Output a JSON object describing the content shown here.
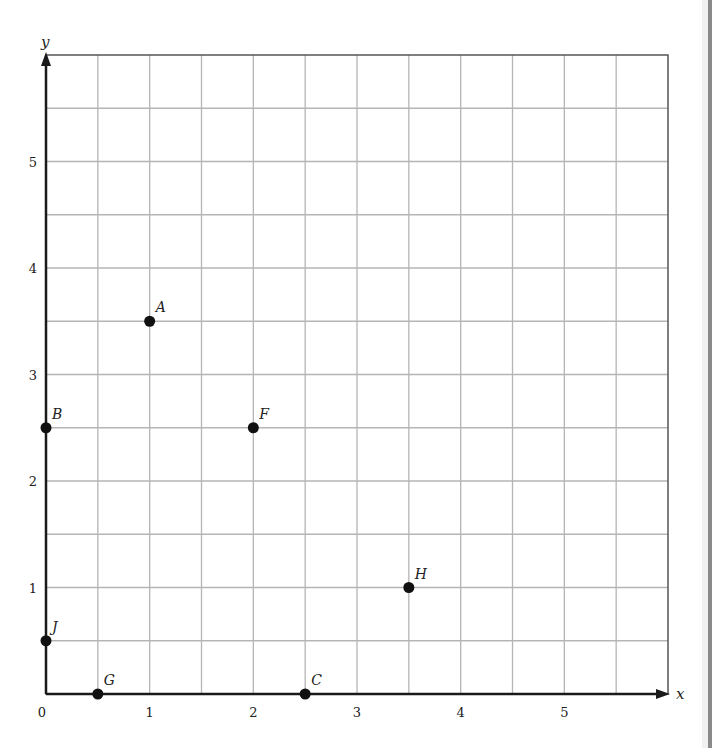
{
  "chart_data": {
    "type": "scatter",
    "title": "",
    "xlabel": "x",
    "ylabel": "y",
    "xlim": [
      0,
      6
    ],
    "ylim": [
      0,
      6
    ],
    "grid": true,
    "grid_step": 0.5,
    "x_ticks": [
      {
        "value": 0,
        "label": "0"
      },
      {
        "value": 1,
        "label": "1"
      },
      {
        "value": 2,
        "label": "2"
      },
      {
        "value": 3,
        "label": "3"
      },
      {
        "value": 4,
        "label": "4"
      },
      {
        "value": 5,
        "label": "5"
      }
    ],
    "y_ticks": [
      {
        "value": 1,
        "label": "1"
      },
      {
        "value": 2,
        "label": "2"
      },
      {
        "value": 3,
        "label": "3"
      },
      {
        "value": 4,
        "label": "4"
      },
      {
        "value": 5,
        "label": "5"
      }
    ],
    "points": [
      {
        "label": "A",
        "x": 1,
        "y": 3.5
      },
      {
        "label": "B",
        "x": 0,
        "y": 2.5
      },
      {
        "label": "F",
        "x": 2,
        "y": 2.5
      },
      {
        "label": "H",
        "x": 3.5,
        "y": 1
      },
      {
        "label": "J",
        "x": 0,
        "y": 0.5
      },
      {
        "label": "G",
        "x": 0.5,
        "y": 0
      },
      {
        "label": "C",
        "x": 2.5,
        "y": 0
      }
    ],
    "legend": null
  },
  "colors": {
    "grid": "#b5b5b5",
    "axis": "#1a1a1a",
    "border": "#555555",
    "point": "#111111",
    "text": "#222222"
  }
}
